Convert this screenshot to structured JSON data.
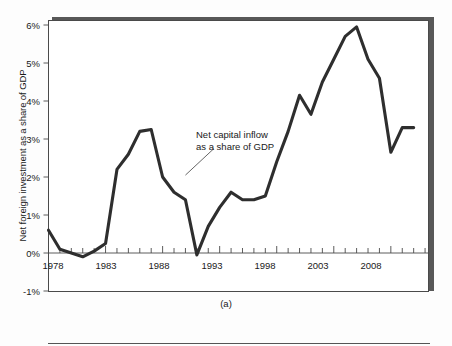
{
  "figure": {
    "panel_caption": "(a)",
    "annotation_line1": "Net capital inflow",
    "annotation_line2": "as a share of GDP",
    "line_color": "#2e2e2e",
    "frame_color": "#4a4a4a",
    "shadow_color": "#585858",
    "background_color": "#ffffff"
  },
  "chart_data": {
    "type": "line",
    "title": "",
    "subtitle": "",
    "xlabel": "",
    "ylabel": "Net foreign investment as a share of GDP",
    "xlim": [
      1978,
      2011
    ],
    "ylim": [
      -1,
      6.2
    ],
    "grid": false,
    "legend": "none",
    "annotations": [
      {
        "text": "Net capital inflow as a share of GDP",
        "x": 1992.5,
        "y": 2.75,
        "leader_from_x": 1990.0,
        "leader_from_y": 2.05
      }
    ],
    "ytick_labels": [
      "6%",
      "5%",
      "4%",
      "3%",
      "2%",
      "1%",
      "0%",
      "-1%"
    ],
    "ytick_values": [
      6,
      5,
      4,
      3,
      2,
      1,
      0,
      -1
    ],
    "xtick_labels": [
      "1978",
      "1983",
      "1988",
      "1993",
      "1998",
      "2003",
      "2008"
    ],
    "xtick_values": [
      1978,
      1983,
      1988,
      1993,
      1998,
      2003,
      2008
    ],
    "minor_tick_interval": 1,
    "series": [
      {
        "name": "Net capital inflow as a share of GDP",
        "color": "#2e2e2e",
        "x": [
          1978,
          1979,
          1980,
          1981,
          1982,
          1983,
          1984,
          1985,
          1986,
          1987,
          1988,
          1989,
          1990,
          1991,
          1992,
          1993,
          1994,
          1995,
          1996,
          1997,
          1998,
          1999,
          2000,
          2001,
          2002,
          2003,
          2004,
          2005,
          2006,
          2007,
          2008,
          2009,
          2010
        ],
        "values": [
          0.6,
          0.1,
          0.0,
          -0.1,
          0.05,
          0.25,
          2.2,
          2.6,
          3.2,
          3.25,
          2.0,
          1.6,
          1.4,
          -0.05,
          0.7,
          1.2,
          1.6,
          1.4,
          1.4,
          1.5,
          2.4,
          3.2,
          4.15,
          3.65,
          4.5,
          5.1,
          5.7,
          5.95,
          5.1,
          4.6,
          2.65,
          3.3,
          3.3
        ]
      }
    ]
  }
}
